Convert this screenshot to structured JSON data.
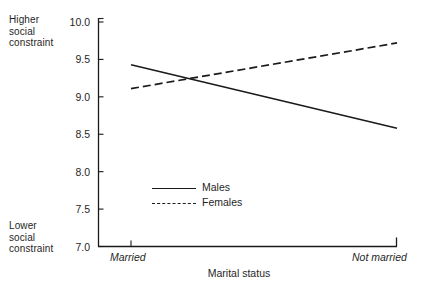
{
  "chart_data": {
    "type": "line",
    "title": "",
    "xlabel": "Marital status",
    "ylabel": "",
    "categories": [
      "Married",
      "Not married"
    ],
    "series": [
      {
        "name": "Males",
        "style": "solid",
        "values": [
          9.43,
          8.58
        ]
      },
      {
        "name": "Females",
        "style": "dashed",
        "values": [
          9.11,
          9.72
        ]
      }
    ],
    "ylim": [
      7.0,
      10.0
    ],
    "yticks": [
      "10.0",
      "9.5",
      "9.0",
      "8.5",
      "8.0",
      "7.5",
      "7.0"
    ],
    "ytick_values": [
      10.0,
      9.5,
      9.0,
      8.5,
      8.0,
      7.5,
      7.0
    ],
    "grid": false,
    "legend_position": "inside-center-lower",
    "y_axis_high_label": "Higher\nsocial\nconstraint",
    "y_axis_low_label": "Lower\nsocial\nconstraint",
    "line_color": "#1a1a1a"
  },
  "axis": {
    "high_annotation": "Higher\nsocial\nconstraint",
    "low_annotation": "Lower\nsocial\nconstraint",
    "x_title": "Marital status",
    "x_categories": [
      "Married",
      "Not married"
    ],
    "y_tick_labels": [
      "10.0",
      "9.5",
      "9.0",
      "8.5",
      "8.0",
      "7.5",
      "7.0"
    ]
  },
  "legend": {
    "entries": [
      {
        "label": "Males",
        "style": "solid"
      },
      {
        "label": "Females",
        "style": "dashed"
      }
    ]
  }
}
